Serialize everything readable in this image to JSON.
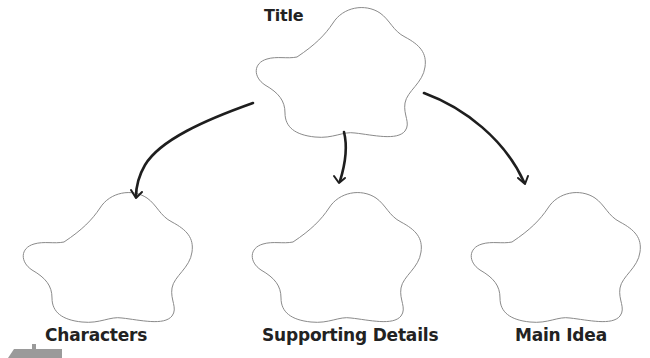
{
  "diagram": {
    "type": "concept-map",
    "nodes": [
      {
        "id": "title",
        "label": "Title",
        "shape": "flower",
        "content": ""
      },
      {
        "id": "characters",
        "label": "Characters",
        "shape": "flower",
        "content": ""
      },
      {
        "id": "supporting",
        "label": "Supporting Details",
        "shape": "flower",
        "content": ""
      },
      {
        "id": "main",
        "label": "Main Idea",
        "shape": "flower",
        "content": ""
      }
    ],
    "edges": [
      {
        "from": "title",
        "to": "characters"
      },
      {
        "from": "title",
        "to": "supporting"
      },
      {
        "from": "title",
        "to": "main"
      }
    ],
    "colors": {
      "outline": "#8a8a8a",
      "arrow": "#1e1e1e",
      "text": "#222222",
      "background": "#ffffff"
    }
  }
}
